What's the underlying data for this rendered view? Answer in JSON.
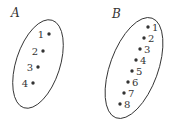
{
  "colors": {
    "stroke": "#333333",
    "background": "#ffffff"
  },
  "sets": [
    {
      "name": "A",
      "label_pos": [
        11,
        17
      ],
      "ellipse": {
        "cx": 38,
        "cy": 64,
        "rx": 22,
        "ry": 46,
        "rotate": 18
      },
      "label_side": "left",
      "points": [
        {
          "label": "1",
          "x": 49,
          "y": 34
        },
        {
          "label": "2",
          "x": 43,
          "y": 51
        },
        {
          "label": "3",
          "x": 38,
          "y": 67
        },
        {
          "label": "4",
          "x": 33,
          "y": 83
        }
      ]
    },
    {
      "name": "B",
      "label_pos": [
        112,
        18
      ],
      "ellipse": {
        "cx": 134,
        "cy": 68,
        "rx": 24,
        "ry": 53,
        "rotate": 20
      },
      "label_side": "right",
      "points": [
        {
          "label": "1",
          "x": 148,
          "y": 27
        },
        {
          "label": "2",
          "x": 144,
          "y": 38
        },
        {
          "label": "3",
          "x": 140,
          "y": 49
        },
        {
          "label": "4",
          "x": 136,
          "y": 60
        },
        {
          "label": "5",
          "x": 132,
          "y": 71
        },
        {
          "label": "6",
          "x": 128,
          "y": 82
        },
        {
          "label": "7",
          "x": 124,
          "y": 93
        },
        {
          "label": "8",
          "x": 120,
          "y": 104
        }
      ]
    }
  ]
}
